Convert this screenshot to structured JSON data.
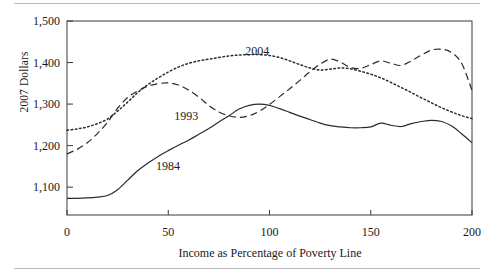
{
  "figure": {
    "rules": [
      "top-rule",
      "bottom-rule"
    ]
  },
  "chart_data": {
    "type": "line",
    "title": "",
    "xlabel": "Income as Percentage of Poverty Line",
    "ylabel": "2007 Dollars",
    "xlim": [
      0,
      200
    ],
    "ylim": [
      1033,
      1500
    ],
    "xticks": [
      0,
      50,
      100,
      150,
      200
    ],
    "xticklabels": [
      "0",
      "50",
      "100",
      "150",
      "200"
    ],
    "yticks": [
      1100,
      1200,
      1300,
      1400,
      1500
    ],
    "yticklabels": [
      "1,100",
      "1,200",
      "1,300",
      "1,400",
      "1,500"
    ],
    "grid": false,
    "legend": "inline-annotations",
    "annotations": [
      {
        "text": "2004",
        "x": 88,
        "y": 1428
      },
      {
        "text": "1993",
        "x": 53,
        "y": 1272
      },
      {
        "text": "1984",
        "x": 44,
        "y": 1152
      }
    ],
    "series": [
      {
        "name": "1984",
        "style": "solid",
        "x": [
          0,
          5,
          10,
          15,
          20,
          25,
          30,
          35,
          40,
          45,
          50,
          55,
          60,
          65,
          70,
          75,
          80,
          85,
          90,
          95,
          100,
          105,
          110,
          115,
          120,
          125,
          130,
          135,
          140,
          145,
          150,
          155,
          160,
          165,
          170,
          175,
          180,
          185,
          190,
          195,
          200
        ],
        "values": [
          1073,
          1073,
          1074,
          1076,
          1080,
          1094,
          1117,
          1140,
          1158,
          1174,
          1188,
          1201,
          1213,
          1227,
          1241,
          1257,
          1272,
          1288,
          1297,
          1300,
          1297,
          1289,
          1280,
          1271,
          1263,
          1254,
          1248,
          1245,
          1243,
          1243,
          1245,
          1254,
          1249,
          1246,
          1253,
          1258,
          1261,
          1258,
          1247,
          1228,
          1207
        ]
      },
      {
        "name": "1993",
        "style": "dashed",
        "x": [
          0,
          5,
          10,
          15,
          20,
          25,
          30,
          35,
          40,
          45,
          50,
          55,
          60,
          65,
          70,
          75,
          80,
          85,
          90,
          95,
          100,
          105,
          110,
          115,
          120,
          125,
          130,
          135,
          140,
          145,
          150,
          155,
          160,
          165,
          170,
          175,
          180,
          185,
          190,
          195,
          200
        ],
        "values": [
          1180,
          1191,
          1207,
          1229,
          1256,
          1290,
          1316,
          1332,
          1343,
          1349,
          1351,
          1346,
          1334,
          1317,
          1297,
          1281,
          1272,
          1268,
          1272,
          1283,
          1299,
          1318,
          1337,
          1357,
          1378,
          1396,
          1408,
          1401,
          1388,
          1386,
          1395,
          1404,
          1398,
          1393,
          1404,
          1418,
          1430,
          1432,
          1424,
          1397,
          1333
        ]
      },
      {
        "name": "2004",
        "style": "dotted",
        "x": [
          0,
          5,
          10,
          15,
          20,
          25,
          30,
          35,
          40,
          45,
          50,
          55,
          60,
          65,
          70,
          75,
          80,
          85,
          90,
          95,
          100,
          105,
          110,
          115,
          120,
          125,
          130,
          135,
          140,
          145,
          150,
          155,
          160,
          165,
          170,
          175,
          180,
          185,
          190,
          195,
          200
        ],
        "values": [
          1237,
          1240,
          1245,
          1253,
          1264,
          1283,
          1305,
          1328,
          1347,
          1363,
          1377,
          1389,
          1398,
          1404,
          1408,
          1412,
          1416,
          1418,
          1419,
          1419,
          1417,
          1412,
          1404,
          1395,
          1387,
          1382,
          1384,
          1387,
          1385,
          1379,
          1372,
          1363,
          1352,
          1340,
          1328,
          1315,
          1303,
          1291,
          1281,
          1272,
          1265
        ]
      }
    ]
  }
}
